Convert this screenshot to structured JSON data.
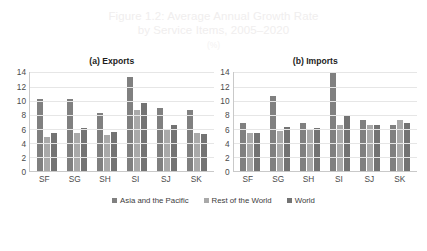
{
  "figure": {
    "title_line1": "Figure 1.2: Average Annual Growth Rate",
    "title_line2": "by Service Items, 2005–2020",
    "unit": "(%)"
  },
  "legend": {
    "items": [
      {
        "label": "Asia and the Pacific",
        "color": "#808080"
      },
      {
        "label": "Rest of the World",
        "color": "#a9a9a9"
      },
      {
        "label": "World",
        "color": "#737373"
      }
    ]
  },
  "footnote": {
    "clipped_text": ""
  },
  "chart_data": [
    {
      "type": "bar",
      "title": "(a) Exports",
      "categories": [
        "SF",
        "SG",
        "SH",
        "SI",
        "SJ",
        "SK"
      ],
      "series": [
        {
          "name": "Asia and the Pacific",
          "color": "#808080",
          "values": [
            10.2,
            10.3,
            8.2,
            13.4,
            8.9,
            8.7
          ]
        },
        {
          "name": "Rest of the World",
          "color": "#a9a9a9",
          "values": [
            4.9,
            5.4,
            5.1,
            8.7,
            5.8,
            5.4
          ]
        },
        {
          "name": "World",
          "color": "#737373",
          "values": [
            5.5,
            6.2,
            5.6,
            9.7,
            6.5,
            5.3
          ]
        }
      ],
      "xlabel": "",
      "ylabel": "",
      "ylim": [
        0,
        14
      ],
      "yticks": [
        0,
        2,
        4,
        6,
        8,
        10,
        12,
        14
      ],
      "grid": true,
      "legend_position": "bottom"
    },
    {
      "type": "bar",
      "title": "(b) Imports",
      "categories": [
        "SF",
        "SG",
        "SH",
        "SI",
        "SJ",
        "SK"
      ],
      "series": [
        {
          "name": "Asia and the Pacific",
          "color": "#808080",
          "values": [
            6.8,
            10.7,
            6.8,
            13.9,
            7.2,
            6.6
          ]
        },
        {
          "name": "Rest of the World",
          "color": "#a9a9a9",
          "values": [
            5.5,
            5.7,
            6.0,
            6.6,
            6.5,
            7.3
          ]
        },
        {
          "name": "World",
          "color": "#737373",
          "values": [
            5.4,
            6.3,
            6.2,
            8.0,
            6.6,
            6.9
          ]
        }
      ],
      "xlabel": "",
      "ylabel": "",
      "ylim": [
        0,
        14
      ],
      "yticks": [
        0,
        2,
        4,
        6,
        8,
        10,
        12,
        14
      ],
      "grid": true,
      "legend_position": "bottom"
    }
  ]
}
